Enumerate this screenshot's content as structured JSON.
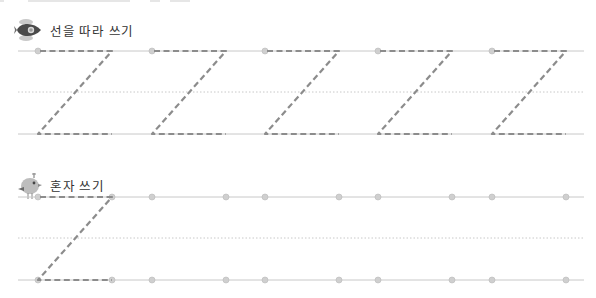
{
  "worksheet": {
    "sections": [
      {
        "id": "trace",
        "title": "선을 따라 쓰기",
        "icon": "rocket-icon",
        "traced_letters": 5,
        "letter_shape": "Z"
      },
      {
        "id": "solo",
        "title": "혼자 쓰기",
        "icon": "bird-icon",
        "traced_letters": 1,
        "letter_shape": "Z",
        "empty_slots": 4
      }
    ],
    "colors": {
      "guide_line": "#c8c8c8",
      "dotted_line": "#c8c8c8",
      "trace_stroke": "#8c8c8c",
      "dot": "#cfcfcf",
      "title_text": "#333333"
    }
  }
}
